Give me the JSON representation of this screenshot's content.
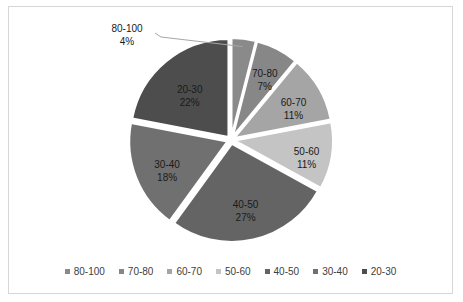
{
  "chart_data": {
    "type": "pie",
    "title": "",
    "categories": [
      "80-100",
      "70-80",
      "60-70",
      "50-60",
      "40-50",
      "30-40",
      "20-30"
    ],
    "values": [
      4,
      7,
      11,
      11,
      27,
      18,
      22
    ],
    "value_unit": "%",
    "data_labels": [
      {
        "category": "80-100",
        "percent": "4%",
        "callout": true
      },
      {
        "category": "70-80",
        "percent": "7%",
        "callout": false
      },
      {
        "category": "60-70",
        "percent": "11%",
        "callout": false
      },
      {
        "category": "50-60",
        "percent": "11%",
        "callout": false
      },
      {
        "category": "40-50",
        "percent": "27%",
        "callout": false
      },
      {
        "category": "30-40",
        "percent": "18%",
        "callout": false
      },
      {
        "category": "20-30",
        "percent": "22%",
        "callout": false
      }
    ],
    "colors": [
      "#8a8a8a",
      "#878787",
      "#a5a5a5",
      "#c4c4c4",
      "#646464",
      "#707070",
      "#4d4d4d"
    ],
    "exploded": true,
    "start_angle_deg": 0,
    "legend": {
      "position": "bottom",
      "entries": [
        "80-100",
        "70-80",
        "60-70",
        "50-60",
        "40-50",
        "30-40",
        "20-30"
      ]
    },
    "xlabel": "",
    "ylabel": "",
    "grid": false
  },
  "frame": {
    "border_color": "#d6d6d6",
    "background_color": "#ffffff"
  }
}
